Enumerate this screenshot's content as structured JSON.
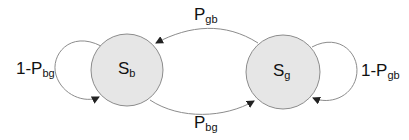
{
  "diagram": {
    "type": "markov-chain",
    "states": [
      {
        "id": "Sb",
        "main": "S",
        "sub": "b"
      },
      {
        "id": "Sg",
        "main": "S",
        "sub": "g"
      }
    ],
    "transitions": [
      {
        "from": "Sg",
        "to": "Sb",
        "main": "P",
        "sub": "gb"
      },
      {
        "from": "Sb",
        "to": "Sg",
        "main": "P",
        "sub": "bg"
      },
      {
        "from": "Sb",
        "to": "Sb",
        "main": "1-P",
        "sub": "bg"
      },
      {
        "from": "Sg",
        "to": "Sg",
        "main": "1-P",
        "sub": "gb"
      }
    ],
    "colors": {
      "state_fill": "#e6e6e6",
      "stroke": "#8c8c8c",
      "arrow": "#222222"
    }
  }
}
